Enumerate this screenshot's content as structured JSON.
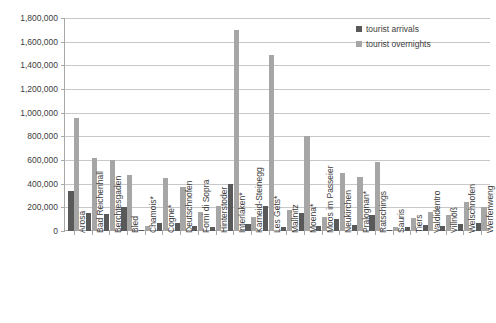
{
  "chart_data": {
    "type": "bar",
    "title": "",
    "xlabel": "",
    "ylabel": "",
    "ylim": [
      0,
      1800000
    ],
    "ytick_labels": [
      "1,800,000",
      "1,600,000",
      "1,400,000",
      "1,200,000",
      "1,000,000",
      "800,000",
      "600,000",
      "400,000",
      "200,000",
      "0"
    ],
    "ytick_values": [
      1800000,
      1600000,
      1400000,
      1200000,
      1000000,
      800000,
      600000,
      400000,
      200000,
      0
    ],
    "grid": true,
    "legend_position": "top-right",
    "categories": [
      "Arosa",
      "Bad Reichenhall",
      "Berchtesgaden",
      "Bled",
      "Chamois*",
      "Cogne*",
      "Deutschnofen",
      "Forni di Sopra",
      "Hinterstoder",
      "Interlaken*",
      "Karneid-Steinegg",
      "Les Gets*",
      "Mallnitz",
      "Moena*",
      "Moos im Passeier",
      "Neukirchen",
      "Pralognan*",
      "Ratschings",
      "Sauris",
      "Tiers",
      "Valdidentro",
      "Villnöß",
      "Welschnofen",
      "Werfenweng"
    ],
    "series": [
      {
        "name": "tourist arrivals",
        "color": "#595959",
        "values": [
          340000,
          150000,
          145000,
          205000,
          8000,
          70000,
          65000,
          40000,
          35000,
          400000,
          60000,
          215000,
          35000,
          155000,
          40000,
          100000,
          55000,
          135000,
          7000,
          35000,
          50000,
          45000,
          60000,
          65000
        ]
      },
      {
        "name": "tourist overnights",
        "color": "#a6a6a6",
        "values": [
          955000,
          615000,
          600000,
          470000,
          40000,
          450000,
          375000,
          160000,
          215000,
          1700000,
          120000,
          1490000,
          175000,
          805000,
          115000,
          490000,
          455000,
          580000,
          35000,
          110000,
          160000,
          135000,
          245000,
          200000
        ]
      }
    ]
  },
  "legend": {
    "items": [
      {
        "label": "tourist arrivals"
      },
      {
        "label": "tourist overnights"
      }
    ]
  }
}
